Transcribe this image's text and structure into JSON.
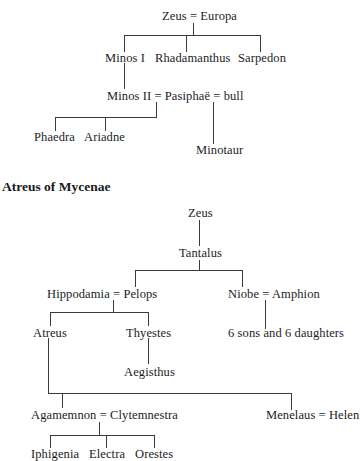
{
  "minoan_tree": {
    "root": "Zeus = Europa",
    "generation_1": [
      "Minos I",
      "Rhadamanthus",
      "Sarpedon"
    ],
    "union": "Minos II = Pasiphaë = bull",
    "children_of_minos": [
      "Phaedra",
      "Ariadne"
    ],
    "child_of_bull": "Minotaur"
  },
  "atreus_tree": {
    "heading": "Atreus of Mycenae",
    "root": "Zeus",
    "son": "Tantalus",
    "tantalus_children": [
      "Hippodamia = Pelops",
      "Niobe = Amphion"
    ],
    "pelops_children": [
      "Atreus",
      "Thyestes"
    ],
    "thyestes_child": "Aegisthus",
    "niobe_children": "6 sons and 6 daughters",
    "atreus_children": [
      "Agamemnon = Clytemnestra",
      "Menelaus = Helen"
    ],
    "agamemnon_children": [
      "Iphigenia",
      "Electra",
      "Orestes"
    ]
  },
  "colors": {
    "background": "#ffffff",
    "text": "#1c1c1c",
    "lines": "#3a3a3a"
  }
}
